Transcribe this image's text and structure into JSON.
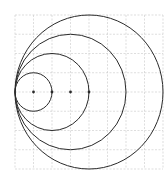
{
  "diagram": {
    "type": "nested-tangent-circles",
    "grid": {
      "cols": 8,
      "rows": 8,
      "line_color": "#c8c8c8",
      "style": "dashed"
    },
    "stroke_color": "#2a2a2a",
    "tangent_point": {
      "x": 0,
      "y": 4
    },
    "circles": [
      {
        "cx": 1,
        "cy": 4,
        "r": 1
      },
      {
        "cx": 2,
        "cy": 4,
        "r": 2
      },
      {
        "cx": 3,
        "cy": 4,
        "r": 3
      },
      {
        "cx": 4,
        "cy": 4,
        "r": 4
      }
    ],
    "center_dots": [
      {
        "x": 1,
        "y": 4
      },
      {
        "x": 2,
        "y": 4
      },
      {
        "x": 3,
        "y": 4
      },
      {
        "x": 4,
        "y": 4
      }
    ]
  }
}
